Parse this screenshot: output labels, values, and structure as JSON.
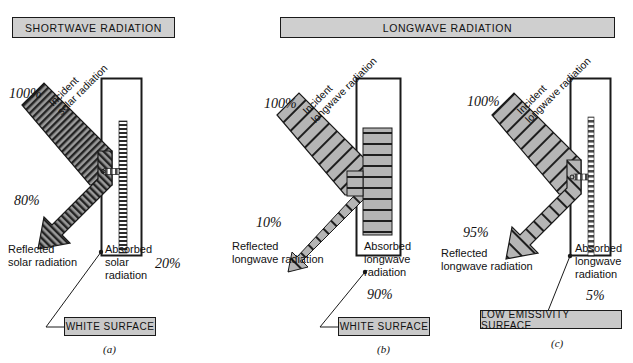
{
  "figure": {
    "panel_letters": [
      "(a)",
      "(b)",
      "(c)"
    ]
  },
  "banners": [
    {
      "label": "SHORTWAVE RADIATION"
    },
    {
      "label": "LONGWAVE RADIATION"
    }
  ],
  "panels": [
    {
      "id": "a",
      "letter": "(a)",
      "banner": "SHORTWAVE RADIATION",
      "surface_label": "WHITE SURFACE",
      "incident": {
        "label": "Incident\nsolar radiation",
        "percent": "100%"
      },
      "reflected": {
        "percent": "80%",
        "label": "Reflected\nsolar radiation"
      },
      "absorbed": {
        "label": "Absorbed\nsolar\nradiation",
        "percent": "20%"
      }
    },
    {
      "id": "b",
      "letter": "(b)",
      "banner": "LONGWAVE RADIATION",
      "surface_label": "WHITE SURFACE",
      "incident": {
        "label": "Incident\nlongwave radiation",
        "percent": "100%"
      },
      "reflected": {
        "percent": "10%",
        "label": "Reflected\nlongwave radiation"
      },
      "absorbed": {
        "label": "Absorbed\nlongwave\nradiation",
        "percent": "90%"
      }
    },
    {
      "id": "c",
      "letter": "(c)",
      "banner": "LONGWAVE RADIATION",
      "surface_label": "LOW EMISSIVITY SURFACE",
      "incident": {
        "label": "Incident\nlongwave radiation",
        "percent": "100%"
      },
      "reflected": {
        "percent": "95%",
        "label": "Reflected\nlongwave radiation"
      },
      "absorbed": {
        "label": "Absorbed\nlongwave\nradiation",
        "percent": "5%"
      }
    }
  ],
  "colors": {
    "ink": "#1a1a1a",
    "banner_fill": "#cfcfcf",
    "surface_fill": "#c9c9c9",
    "shortwave_arrow_fill": "#8f8f8f",
    "longwave_arrow_fill": "#b5b5b5",
    "background": "#ffffff"
  }
}
